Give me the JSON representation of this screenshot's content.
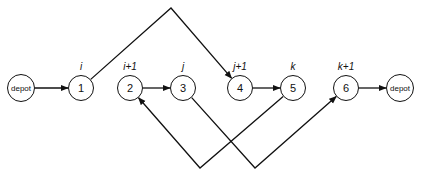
{
  "diagram": {
    "type": "vehicle-route-3-opt-move",
    "nodes": [
      {
        "id": "depot-start",
        "text": "depot",
        "label": "",
        "cx": 21,
        "cy": 88,
        "depot": true
      },
      {
        "id": "n1",
        "text": "1",
        "label": "i",
        "cx": 81,
        "cy": 88,
        "depot": false
      },
      {
        "id": "n2",
        "text": "2",
        "label": "i+1",
        "cx": 130,
        "cy": 88,
        "depot": false
      },
      {
        "id": "n3",
        "text": "3",
        "label": "j",
        "cx": 183,
        "cy": 88,
        "depot": false
      },
      {
        "id": "n4",
        "text": "4",
        "label": "j+1",
        "cx": 240,
        "cy": 88,
        "depot": false
      },
      {
        "id": "n5",
        "text": "5",
        "label": "k",
        "cx": 293,
        "cy": 88,
        "depot": false
      },
      {
        "id": "n6",
        "text": "6",
        "label": "k+1",
        "cx": 346,
        "cy": 88,
        "depot": false
      },
      {
        "id": "depot-end",
        "text": "depot",
        "label": "",
        "cx": 400,
        "cy": 88,
        "depot": true
      }
    ],
    "edges": [
      {
        "from": "depot-start",
        "to": "n1",
        "kind": "straight"
      },
      {
        "from": "n2",
        "to": "n3",
        "kind": "straight"
      },
      {
        "from": "n4",
        "to": "n5",
        "kind": "straight"
      },
      {
        "from": "n6",
        "to": "depot-end",
        "kind": "straight"
      },
      {
        "from": "n1",
        "to": "n4",
        "kind": "over-top",
        "via": [
          171,
          8
        ]
      },
      {
        "from": "n5",
        "to": "n2",
        "kind": "under-bottom",
        "via": [
          200,
          168
        ]
      },
      {
        "from": "n3",
        "to": "n6",
        "kind": "under-bottom",
        "via": [
          255,
          168
        ]
      }
    ],
    "colors": {
      "stroke": "#111111",
      "background": "#ffffff"
    }
  }
}
